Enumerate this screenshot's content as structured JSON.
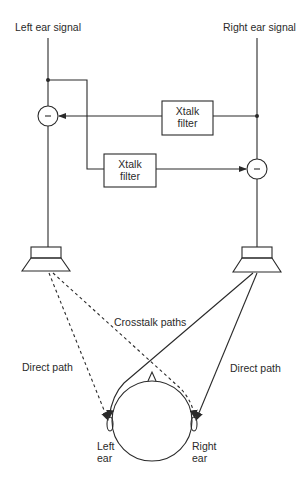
{
  "diagram": {
    "inputs": {
      "left": "Left ear signal",
      "right": "Right ear signal"
    },
    "filters": {
      "upper": {
        "line1": "Xtalk",
        "line2": "filter"
      },
      "lower": {
        "line1": "Xtalk",
        "line2": "filter"
      }
    },
    "summing_nodes": {
      "left_symbol": "−",
      "right_symbol": "−"
    },
    "paths": {
      "crosstalk": "Crosstalk paths",
      "direct_left": "Direct path",
      "direct_right": "Direct path"
    },
    "ears": {
      "left": {
        "line1": "Left",
        "line2": "ear"
      },
      "right": {
        "line1": "Right",
        "line2": "ear"
      }
    },
    "colors": {
      "line": "#2a2a2a",
      "background": "#ffffff"
    }
  }
}
